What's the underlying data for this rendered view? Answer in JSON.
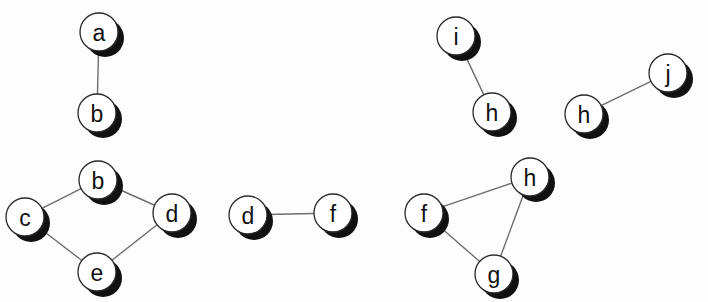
{
  "diagram": {
    "kind": "undirected-graph-components",
    "canvas": {
      "width": 708,
      "height": 302,
      "background": "#fdfdfd"
    },
    "style": {
      "node_fill": "#ffffff",
      "node_stroke": "#2a2a2a",
      "node_radius": 19,
      "label_color": "#111111",
      "edge_color": "#6e6e6e",
      "shadow_color": "#111111",
      "shadow_offset_x": 6,
      "shadow_offset_y": 6
    },
    "components": [
      {
        "id": "component-1",
        "name": "a-b-pair",
        "nodes": [
          {
            "id": "n1",
            "label": "a",
            "cx": 99,
            "cy": 32
          },
          {
            "id": "n2",
            "label": "b",
            "cx": 97,
            "cy": 113
          }
        ],
        "edges": [
          {
            "from": "n1",
            "to": "n2"
          }
        ]
      },
      {
        "id": "component-2",
        "name": "b-c-d-e-cycle",
        "nodes": [
          {
            "id": "n3",
            "label": "b",
            "cx": 98,
            "cy": 180
          },
          {
            "id": "n4",
            "label": "c",
            "cx": 25,
            "cy": 217
          },
          {
            "id": "n5",
            "label": "d",
            "cx": 172,
            "cy": 213
          },
          {
            "id": "n6",
            "label": "e",
            "cx": 97,
            "cy": 272
          }
        ],
        "edges": [
          {
            "from": "n3",
            "to": "n4"
          },
          {
            "from": "n3",
            "to": "n5"
          },
          {
            "from": "n4",
            "to": "n6"
          },
          {
            "from": "n6",
            "to": "n5"
          }
        ]
      },
      {
        "id": "component-3",
        "name": "d-f-pair",
        "nodes": [
          {
            "id": "n7",
            "label": "d",
            "cx": 248,
            "cy": 215
          },
          {
            "id": "n8",
            "label": "f",
            "cx": 333,
            "cy": 213
          }
        ],
        "edges": [
          {
            "from": "n7",
            "to": "n8"
          }
        ]
      },
      {
        "id": "component-4",
        "name": "f-g-h-triangle",
        "nodes": [
          {
            "id": "n9",
            "label": "f",
            "cx": 424,
            "cy": 213
          },
          {
            "id": "n10",
            "label": "h",
            "cx": 530,
            "cy": 177
          },
          {
            "id": "n11",
            "label": "g",
            "cx": 494,
            "cy": 274
          }
        ],
        "edges": [
          {
            "from": "n9",
            "to": "n10"
          },
          {
            "from": "n9",
            "to": "n11"
          },
          {
            "from": "n11",
            "to": "n10"
          }
        ]
      },
      {
        "id": "component-5",
        "name": "i-h-pair",
        "nodes": [
          {
            "id": "n12",
            "label": "i",
            "cx": 456,
            "cy": 36
          },
          {
            "id": "n13",
            "label": "h",
            "cx": 492,
            "cy": 112
          }
        ],
        "edges": [
          {
            "from": "n12",
            "to": "n13"
          }
        ]
      },
      {
        "id": "component-6",
        "name": "h-j-pair",
        "nodes": [
          {
            "id": "n14",
            "label": "h",
            "cx": 584,
            "cy": 114
          },
          {
            "id": "n15",
            "label": "j",
            "cx": 668,
            "cy": 73
          }
        ],
        "edges": [
          {
            "from": "n14",
            "to": "n15"
          }
        ]
      }
    ]
  }
}
